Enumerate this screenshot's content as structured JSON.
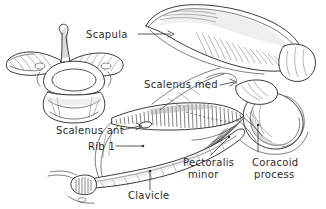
{
  "figure": {
    "style": "pen-and-ink line drawing with hatching",
    "background_color": "#ffffff",
    "ink_color": "#2b2b2b",
    "width": 326,
    "height": 209
  },
  "labels": [
    {
      "id": "scapula",
      "text": "Scapula",
      "x": 86,
      "y": 38,
      "anchor": "start",
      "leader": "M138,34 L172,34",
      "points_to": "scapula blade"
    },
    {
      "id": "scalenus-med",
      "text": "Scalenus med",
      "x": 144,
      "y": 88,
      "anchor": "start",
      "leader": "M222,84 L236,82",
      "points_to": "scalenus medius tubercle on first rib"
    },
    {
      "id": "scalenus-ant",
      "text": "Scalenus ant",
      "x": 56,
      "y": 134,
      "anchor": "start",
      "leader": "M124,130 L142,126",
      "points_to": "scalene tubercle of first rib"
    },
    {
      "id": "rib-1",
      "text": "Rib 1",
      "x": 88,
      "y": 150,
      "anchor": "start",
      "leader": "M118,146 L146,146",
      "points_to": "first rib"
    },
    {
      "id": "pectoralis-minor",
      "text": "Pectoralis",
      "text_line2": "minor",
      "x": 183,
      "y": 166,
      "anchor": "start",
      "leader": "M212,156 L226,140",
      "points_to": "pectoralis minor insertion"
    },
    {
      "id": "coracoid-process",
      "text": "Coracoid",
      "text_line2": "process",
      "x": 252,
      "y": 166,
      "anchor": "start",
      "leader": "M258,152 L258,128",
      "points_to": "coracoid process of scapula"
    },
    {
      "id": "clavicle",
      "text": "Clavicle",
      "x": 128,
      "y": 199,
      "anchor": "start",
      "leader": "M150,190 L150,174",
      "points_to": "clavicle shaft"
    }
  ],
  "structures": [
    {
      "id": "cervical-vertebra",
      "name": "Cervical vertebra (superior view)"
    },
    {
      "id": "scapula-blade",
      "name": "Scapula blade"
    },
    {
      "id": "scapular-spine",
      "name": "Spine of scapula"
    },
    {
      "id": "glenoid-fossa",
      "name": "Glenoid fossa"
    },
    {
      "id": "coracoid",
      "name": "Coracoid process"
    },
    {
      "id": "first-rib",
      "name": "First rib"
    },
    {
      "id": "clavicle-shaft",
      "name": "Clavicle"
    },
    {
      "id": "pec-minor-fibers",
      "name": "Pectoralis minor muscle fibers"
    }
  ]
}
